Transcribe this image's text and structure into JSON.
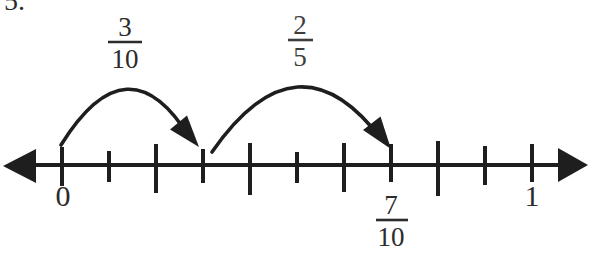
{
  "question": {
    "number_label": "5."
  },
  "colors": {
    "ink": "#1e1e1e",
    "label_ink": "#2b2b2b",
    "jump2_ink": "#3d3d3d",
    "background": "#ffffff"
  },
  "number_line": {
    "min_label": "0",
    "max_label": "1",
    "tick_values": [
      "0",
      "1/10",
      "2/10",
      "3/10",
      "4/10",
      "5/10",
      "6/10",
      "7/10",
      "8/10",
      "9/10",
      "1"
    ],
    "point_label": {
      "numerator": "7",
      "denominator": "10",
      "at": "7/10"
    }
  },
  "jumps": [
    {
      "from": "0",
      "to": "3/10",
      "label": {
        "numerator": "3",
        "denominator": "10"
      }
    },
    {
      "from": "3/10",
      "to": "7/10",
      "label": {
        "numerator": "2",
        "denominator": "5"
      }
    }
  ]
}
